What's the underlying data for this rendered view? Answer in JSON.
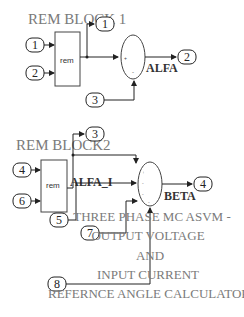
{
  "block1": {
    "title": "REM BLOCK 1",
    "rem_label": "rem",
    "inputs": [
      "1",
      "2",
      "3"
    ],
    "outputs": [
      "1",
      "2"
    ],
    "signal_label": "ALFA"
  },
  "block2": {
    "title": "REM BLOCK2",
    "rem_label": "rem",
    "inputs": [
      "4",
      "6",
      "5",
      "7",
      "8"
    ],
    "outputs": [
      "3",
      "4"
    ],
    "internal_label": "ALFA_I",
    "signal_label": "BETA"
  },
  "caption": {
    "line1": "THREE PHASE MC ASVM -",
    "line2": "OUTPUT VOLTAGE",
    "line3": "AND",
    "line4": "INPUT CURRENT",
    "line5": "REFERNCE ANGLE CALCULATOR"
  }
}
